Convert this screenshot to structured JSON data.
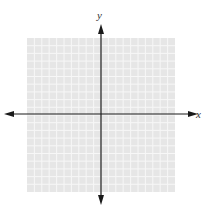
{
  "diagram": {
    "type": "coordinate-plane",
    "x_axis_label": "x",
    "y_axis_label": "y",
    "grid": {
      "cells_x": 20,
      "cells_y": 20,
      "fill_color": "#e6e6e6",
      "line_color": "#f7f7f7"
    },
    "axis_color": "#1a1a1a"
  }
}
